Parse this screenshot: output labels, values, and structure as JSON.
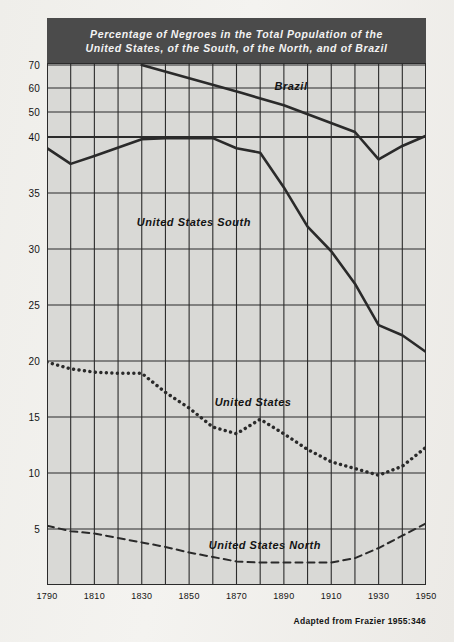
{
  "figure": {
    "title_line1": "Percentage of Negroes in the Total Population of the",
    "title_line2": "United States, of the South, of the North, and of Brazil",
    "credit": "Adapted from Frazier 1955:346",
    "colors": {
      "title_bar": "#4b4b4b",
      "title_text": "#f3f3f3",
      "plot_background": "#d9d9d6",
      "grid": "#2b2b2b",
      "line": "#2a2a2a",
      "paper": "#efeeea"
    }
  },
  "chart_data": {
    "type": "line",
    "title": "Percentage of Negroes in the Total Population of the United States, of the South, of the North, and of Brazil",
    "xlabel": "",
    "ylabel": "",
    "xlim": [
      1790,
      1950
    ],
    "ylim": [
      0,
      75
    ],
    "grid": true,
    "legend": "inline-labels",
    "x_ticks": [
      1790,
      1810,
      1830,
      1850,
      1870,
      1890,
      1910,
      1930,
      1950
    ],
    "x_gridlines": [
      1790,
      1800,
      1810,
      1820,
      1830,
      1840,
      1850,
      1860,
      1870,
      1880,
      1890,
      1900,
      1910,
      1920,
      1930,
      1940,
      1950
    ],
    "y_ticks": [
      5,
      10,
      15,
      20,
      25,
      30,
      35,
      40,
      50,
      60,
      70
    ],
    "y_axis_note": "Non-linear scale: compressed above 40",
    "series": [
      {
        "name": "Brazil",
        "style": "solid",
        "label_x": 1893,
        "label_y": 61,
        "x": [
          1830,
          1872,
          1890,
          1920,
          1930,
          1940,
          1950
        ],
        "values": [
          70.0,
          58.0,
          52.8,
          42.0,
          38.0,
          39.2,
          40.5
        ]
      },
      {
        "name": "United States South",
        "style": "solid",
        "label_x": 1852,
        "label_y": 32.4,
        "x": [
          1790,
          1800,
          1810,
          1830,
          1840,
          1860,
          1870,
          1880,
          1890,
          1900,
          1910,
          1920,
          1930,
          1940,
          1950
        ],
        "values": [
          39.0,
          37.6,
          38.3,
          39.8,
          39.9,
          39.9,
          39.0,
          38.6,
          35.5,
          32.0,
          29.8,
          26.9,
          23.2,
          22.3,
          20.8
        ]
      },
      {
        "name": "United States",
        "style": "dotted",
        "label_x": 1877,
        "label_y": 16.3,
        "x": [
          1790,
          1800,
          1810,
          1820,
          1830,
          1840,
          1850,
          1860,
          1870,
          1880,
          1890,
          1900,
          1910,
          1920,
          1930,
          1940,
          1950
        ],
        "values": [
          19.9,
          19.3,
          19.0,
          18.9,
          18.9,
          17.2,
          15.8,
          14.1,
          13.5,
          14.8,
          13.5,
          12.1,
          11.0,
          10.4,
          9.8,
          10.6,
          12.3
        ]
      },
      {
        "name": "United States North",
        "style": "dashed",
        "label_x": 1882,
        "label_y": 3.6,
        "x": [
          1790,
          1800,
          1810,
          1820,
          1830,
          1840,
          1850,
          1860,
          1870,
          1880,
          1890,
          1900,
          1910,
          1920,
          1930,
          1940,
          1950
        ],
        "values": [
          5.3,
          4.8,
          4.6,
          4.2,
          3.8,
          3.4,
          2.9,
          2.5,
          2.1,
          2.0,
          2.0,
          2.0,
          2.0,
          2.4,
          3.3,
          4.4,
          5.5
        ]
      }
    ]
  }
}
